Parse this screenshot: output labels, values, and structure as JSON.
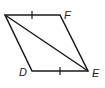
{
  "diagram": {
    "type": "parallelogram",
    "vertices": [
      {
        "name": "",
        "x": 5,
        "y": 15
      },
      {
        "name": "F",
        "x": 60,
        "y": 15
      },
      {
        "name": "E",
        "x": 88,
        "y": 71
      },
      {
        "name": "D",
        "x": 32,
        "y": 71
      }
    ],
    "labels": {
      "F": "F",
      "D": "D",
      "E": "E"
    },
    "diagonal": {
      "from": "top-left",
      "to": "E"
    },
    "congruent_marks": [
      "top-side",
      "bottom-side"
    ],
    "stroke_color": "#1a1a1a"
  }
}
